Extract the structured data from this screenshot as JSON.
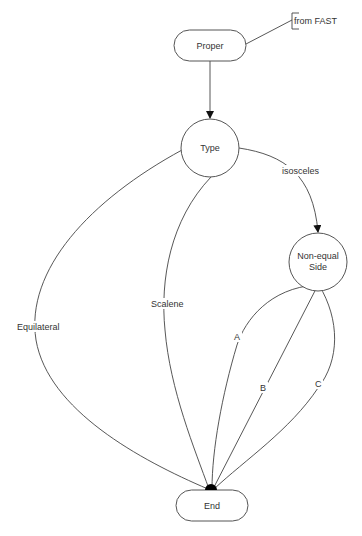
{
  "diagram": {
    "type": "state-flow",
    "nodes": {
      "proper": {
        "label": "Proper",
        "shape": "rounded-rect"
      },
      "type": {
        "label": "Type",
        "shape": "circle"
      },
      "non_equal_side": {
        "label_line1": "Non-equal",
        "label_line2": "Side",
        "shape": "circle"
      },
      "end": {
        "label": "End",
        "shape": "rounded-rect"
      }
    },
    "annotation": {
      "label": "from FAST"
    },
    "edges": {
      "proper_to_type": {
        "label": ""
      },
      "type_to_non_equal": {
        "label": "isosceles"
      },
      "type_to_end_equilateral": {
        "label": "Equilateral"
      },
      "type_to_end_scalene": {
        "label": "Scalene"
      },
      "non_equal_to_end_a": {
        "label": "A"
      },
      "non_equal_to_end_b": {
        "label": "B"
      },
      "non_equal_to_end_c": {
        "label": "C"
      }
    },
    "colors": {
      "stroke": "#444444",
      "text": "#333333",
      "background": "#ffffff",
      "join_dot": "#000000"
    }
  }
}
